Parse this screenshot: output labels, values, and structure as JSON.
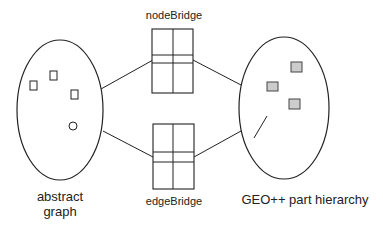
{
  "labels": {
    "node_bridge": "nodeBridge",
    "edge_bridge": "edgeBridge",
    "abstract_graph_line1": "abstract",
    "abstract_graph_line2": "graph",
    "geo_hierarchy": "GEO++ part hierarchy"
  },
  "colors": {
    "stroke": "#222222",
    "filled_node": "#cccccc",
    "background": "#ffffff"
  }
}
